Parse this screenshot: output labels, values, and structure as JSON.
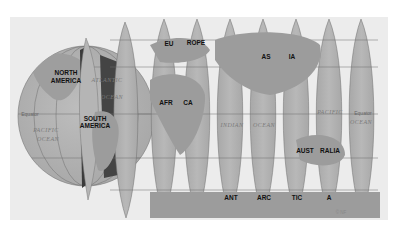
{
  "map": {
    "title": "Globe gores projection",
    "type": "interrupted globe gores",
    "colors": {
      "panel_bg": "#eeeeee",
      "ocean": "#b3b3b3",
      "land": "#9a9a9a",
      "polar_cap": "#8c8c8c",
      "shadow": "#3c3c3c",
      "grid": "#6e6e6e"
    },
    "continent_labels": [
      {
        "id": "north-america-line1",
        "text": "NORTH",
        "x": 66,
        "y": 75
      },
      {
        "id": "north-america-line2",
        "text": "AMERICA",
        "x": 66,
        "y": 83
      },
      {
        "id": "south-america-line1",
        "text": "SOUTH",
        "x": 95,
        "y": 121
      },
      {
        "id": "south-america-line2",
        "text": "AMERICA",
        "x": 95,
        "y": 128
      },
      {
        "id": "europe-part1",
        "text": "EU",
        "x": 169,
        "y": 46
      },
      {
        "id": "europe-part2",
        "text": "ROPE",
        "x": 196,
        "y": 45
      },
      {
        "id": "africa-part1",
        "text": "AFR",
        "x": 166,
        "y": 105
      },
      {
        "id": "africa-part2",
        "text": "CA",
        "x": 188,
        "y": 105
      },
      {
        "id": "asia-part1",
        "text": "AS",
        "x": 266,
        "y": 59
      },
      {
        "id": "asia-part2",
        "text": "IA",
        "x": 292,
        "y": 59
      },
      {
        "id": "australia-part1",
        "text": "AUST",
        "x": 305,
        "y": 153
      },
      {
        "id": "australia-part2",
        "text": "RALIA",
        "x": 330,
        "y": 153
      },
      {
        "id": "antarctica-part1",
        "text": "ANT",
        "x": 231,
        "y": 200
      },
      {
        "id": "antarctica-part2",
        "text": "ARC",
        "x": 264,
        "y": 200
      },
      {
        "id": "antarctica-part3",
        "text": "TIC",
        "x": 297,
        "y": 200
      },
      {
        "id": "antarctica-part4",
        "text": "A",
        "x": 329,
        "y": 200
      }
    ],
    "ocean_labels": [
      {
        "id": "atlantic-line1",
        "text": "ATLANTIC",
        "x": 107,
        "y": 82
      },
      {
        "id": "atlantic-line2",
        "text": "OCEAN",
        "x": 112,
        "y": 99
      },
      {
        "id": "pacific-west-line1",
        "text": "PACIFIC",
        "x": 46,
        "y": 132
      },
      {
        "id": "pacific-west-line2",
        "text": "OCEAN",
        "x": 48,
        "y": 141
      },
      {
        "id": "indian-part1",
        "text": "INDIAN",
        "x": 232,
        "y": 127
      },
      {
        "id": "indian-part2",
        "text": "OCEAN",
        "x": 264,
        "y": 127
      },
      {
        "id": "pacific-east-line1",
        "text": "PACIFIC",
        "x": 330,
        "y": 114
      },
      {
        "id": "pacific-east-line2",
        "text": "OCEAN",
        "x": 361,
        "y": 124
      }
    ],
    "equator_labels": [
      {
        "id": "equator-west",
        "text": "Equator",
        "x": 30,
        "y": 116
      },
      {
        "id": "equator-east",
        "text": "Equator",
        "x": 363,
        "y": 115
      }
    ],
    "credit": {
      "text": "© NF",
      "x": 341,
      "y": 214
    }
  }
}
